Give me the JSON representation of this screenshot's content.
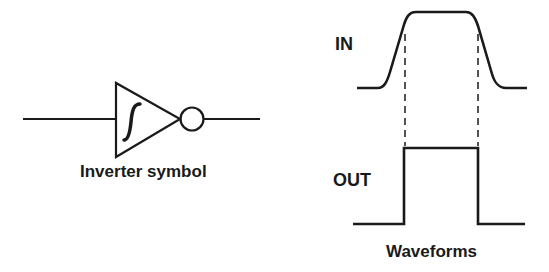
{
  "diagram": {
    "colors": {
      "stroke": "#1a1a1a",
      "background": "#ffffff"
    },
    "inverter": {
      "caption": "Inverter symbol",
      "symbol": "schmitt-hysteresis-glyph"
    },
    "waveforms": {
      "caption": "Waveforms",
      "input_label": "IN",
      "output_label": "OUT"
    }
  }
}
